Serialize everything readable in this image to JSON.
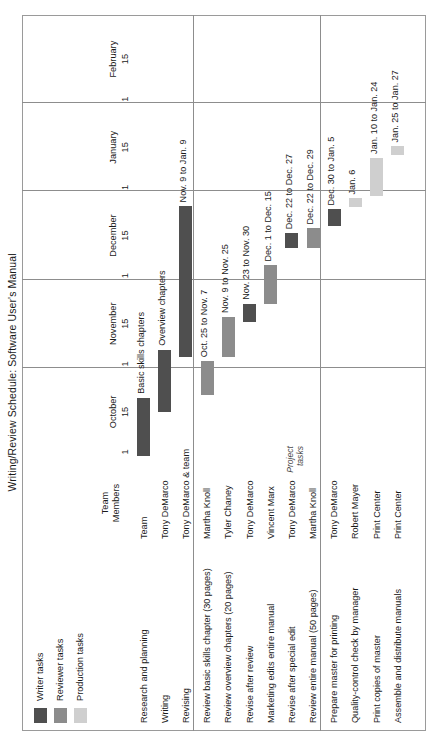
{
  "chart_data": {
    "type": "bar",
    "title": "Writing/Review Schedule: Software User's Manual",
    "xlabel": "",
    "ylabel": "",
    "grid": true,
    "legend_position": "top-left",
    "axis": {
      "months": [
        "October",
        "November",
        "December",
        "January",
        "February"
      ],
      "ticks": [
        "1",
        "15"
      ],
      "range_start": "October 1",
      "range_end": "February 15"
    },
    "columns": [
      "",
      "Team Members"
    ],
    "legend": [
      {
        "label": "Writer tasks",
        "color": "#4f4f4f"
      },
      {
        "label": "Reviewer tasks",
        "color": "#8c8c8c"
      },
      {
        "label": "Production tasks",
        "color": "#cfcfcf"
      }
    ],
    "side_note": "Project tasks",
    "groups": [
      {
        "rows": [
          {
            "task": "Research and planning",
            "member": "Team",
            "bar_label": "Basic skills chapters",
            "label_placement": "right",
            "category": "Writer tasks",
            "color": "#4f4f4f",
            "start": "Oct. 1",
            "end": "Oct. 24",
            "start_pct": 0.0,
            "end_pct": 13.2
          },
          {
            "task": "Writing",
            "member": "Tony DeMarco",
            "bar_label": "Overview chapters",
            "label_placement": "right",
            "category": "Writer tasks",
            "color": "#4f4f4f",
            "start": "Oct. 18",
            "end": "Nov. 12",
            "start_pct": 9.9,
            "end_pct": 24.1
          },
          {
            "task": "Revising",
            "member": "Tony DeMarco & team",
            "bar_label": "Nov. 9 to Jan. 9",
            "label_placement": "right",
            "category": "Writer tasks",
            "color": "#4f4f4f",
            "start": "Nov. 9",
            "end": "Jan. 9",
            "start_pct": 22.4,
            "end_pct": 56.6
          }
        ]
      },
      {
        "rows": [
          {
            "task": "Review basic skills chapter (30 pages)",
            "member": "Martha Knoll",
            "bar_label": "Oct. 25 to Nov. 7",
            "label_placement": "right",
            "category": "Reviewer tasks",
            "color": "#8c8c8c",
            "start": "Oct. 25",
            "end": "Nov. 7",
            "start_pct": 13.8,
            "end_pct": 21.5
          },
          {
            "task": "Review overview chapters (20 pages)",
            "member": "Tyler Chaney",
            "bar_label": "Nov. 9 to Nov. 25",
            "label_placement": "right",
            "category": "Reviewer tasks",
            "color": "#8c8c8c",
            "start": "Nov. 9",
            "end": "Nov. 25",
            "start_pct": 22.4,
            "end_pct": 31.5
          },
          {
            "task": "Revise after review",
            "member": "Tony DeMarco",
            "bar_label": "Nov. 23 to Nov. 30",
            "label_placement": "right",
            "category": "Writer tasks",
            "color": "#4f4f4f",
            "start": "Nov. 23",
            "end": "Nov. 30",
            "start_pct": 30.3,
            "end_pct": 34.5
          },
          {
            "task": "Marketing edits entire manual",
            "member": "Vincent Marx",
            "bar_label": "Dec. 1 to Dec. 15",
            "label_placement": "right",
            "category": "Reviewer tasks",
            "color": "#8c8c8c",
            "start": "Dec. 1",
            "end": "Dec. 15",
            "start_pct": 34.5,
            "end_pct": 43.2
          },
          {
            "task": "Revise after special edit",
            "member": "Tony DeMarco",
            "bar_label": "Dec. 22 to Dec. 27",
            "label_placement": "right",
            "category": "Writer tasks",
            "color": "#4f4f4f",
            "start": "Dec. 22",
            "end": "Dec. 27",
            "start_pct": 47.2,
            "end_pct": 50.5
          },
          {
            "task": "Review entire manual (50 pages)",
            "member": "Martha Knoll",
            "bar_label": "Dec. 22 to Dec. 29",
            "label_placement": "right",
            "category": "Reviewer tasks",
            "color": "#8c8c8c",
            "start": "Dec. 22",
            "end": "Dec. 29",
            "start_pct": 47.2,
            "end_pct": 51.6
          }
        ]
      },
      {
        "rows": [
          {
            "task": "Prepare master for printing",
            "member": "Tony DeMarco",
            "bar_label": "Dec. 30 to Jan. 5",
            "label_placement": "right",
            "category": "Writer tasks",
            "color": "#4f4f4f",
            "start": "Dec. 30",
            "end": "Jan. 5",
            "start_pct": 52.1,
            "end_pct": 55.9
          },
          {
            "task": "Quality-control check by manager",
            "member": "Robert Mayer",
            "bar_label": "Jan. 6",
            "label_placement": "right",
            "category": "Production tasks",
            "color": "#cfcfcf",
            "start": "Jan. 6",
            "end": "Jan. 9",
            "start_pct": 56.4,
            "end_pct": 58.4
          },
          {
            "task": "Print copies of master",
            "member": "Print Center",
            "bar_label": "Jan. 10 to Jan. 24",
            "label_placement": "right",
            "category": "Production tasks",
            "color": "#cfcfcf",
            "start": "Jan. 10",
            "end": "Jan. 24",
            "start_pct": 58.9,
            "end_pct": 67.6
          },
          {
            "task": "Assemble and distribute manuals",
            "member": "Print Center",
            "bar_label": "Jan. 25 to Jan. 27",
            "label_placement": "right",
            "category": "Production tasks",
            "color": "#cfcfcf",
            "start": "Jan. 25",
            "end": "Jan. 27",
            "start_pct": 68.2,
            "end_pct": 70.2
          }
        ]
      }
    ]
  }
}
